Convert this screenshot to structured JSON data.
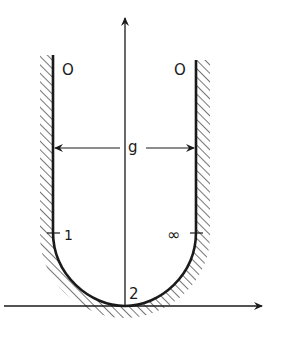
{
  "diagram": {
    "type": "u-shaped channel / gap cross-section",
    "labels": {
      "top_left": "O",
      "top_right": "O",
      "gap": "g",
      "left_point": "1",
      "right_point": "∞",
      "bottom_point": "2"
    },
    "axes": {
      "vertical": "upward arrow along centerline",
      "horizontal": "rightward arrow along bottom tangent"
    },
    "colors": {
      "ink": "#1a1a1a",
      "background": "#ffffff"
    }
  }
}
